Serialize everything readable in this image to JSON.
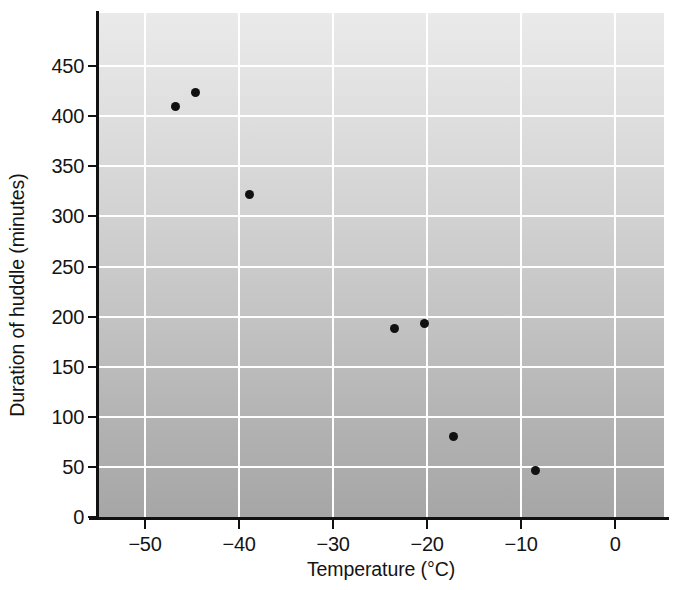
{
  "chart_data": {
    "type": "scatter",
    "title": "",
    "xlabel": "Temperature (°C)",
    "ylabel": "Duration of huddle (minutes)",
    "xlim": [
      -55,
      5.2
    ],
    "ylim": [
      0,
      503
    ],
    "grid": true,
    "legend": null,
    "xticks": [
      -50,
      -40,
      -30,
      -20,
      -10,
      0
    ],
    "xtick_labels": [
      "−50",
      "−40",
      "−30",
      "−20",
      "−10",
      "0"
    ],
    "yticks": [
      0,
      50,
      100,
      150,
      200,
      250,
      300,
      350,
      400,
      450
    ],
    "ytick_labels": [
      "0",
      "50",
      "100",
      "150",
      "200",
      "250",
      "300",
      "350",
      "400",
      "450"
    ],
    "points": [
      {
        "x": -46.8,
        "y": 410
      },
      {
        "x": -44.6,
        "y": 424
      },
      {
        "x": -38.9,
        "y": 322
      },
      {
        "x": -23.5,
        "y": 188
      },
      {
        "x": -20.3,
        "y": 193
      },
      {
        "x": -17.2,
        "y": 80
      },
      {
        "x": -8.5,
        "y": 46
      }
    ],
    "colors": {
      "marker": "#111111",
      "gridline": "#ffffff",
      "axis": "#111111",
      "plot_background_top": "#eaeaea",
      "plot_background_bottom": "#a6a6a6",
      "figure_background": "#ffffff"
    }
  }
}
